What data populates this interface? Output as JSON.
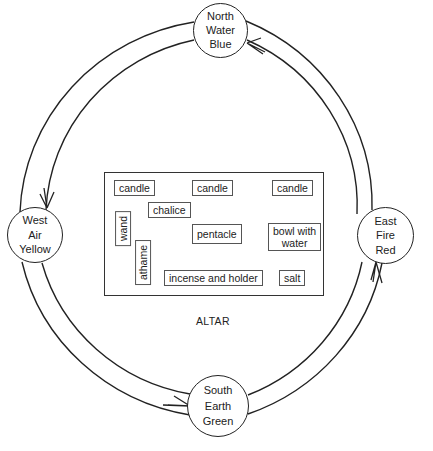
{
  "diagram": {
    "type": "ritual circle layout",
    "flow_direction": "counter-clockwise (East → North → West → South → East)",
    "line_color": "#222222"
  },
  "quarters": {
    "north": {
      "direction": "North",
      "element": "Water",
      "color": "Blue"
    },
    "west": {
      "direction": "West",
      "element": "Air",
      "color": "Yellow"
    },
    "east": {
      "direction": "East",
      "element": "Fire",
      "color": "Red"
    },
    "south": {
      "direction": "South",
      "element": "Earth",
      "color": "Green"
    }
  },
  "altar": {
    "label": "ALTAR",
    "items": {
      "candle_left": "candle",
      "candle_center": "candle",
      "candle_right": "candle",
      "chalice": "chalice",
      "wand": "wand",
      "pentacle": "pentacle",
      "bowl_line1": "bowl with",
      "bowl_line2": "water",
      "athame": "athame",
      "incense": "incense and holder",
      "salt": "salt"
    }
  }
}
